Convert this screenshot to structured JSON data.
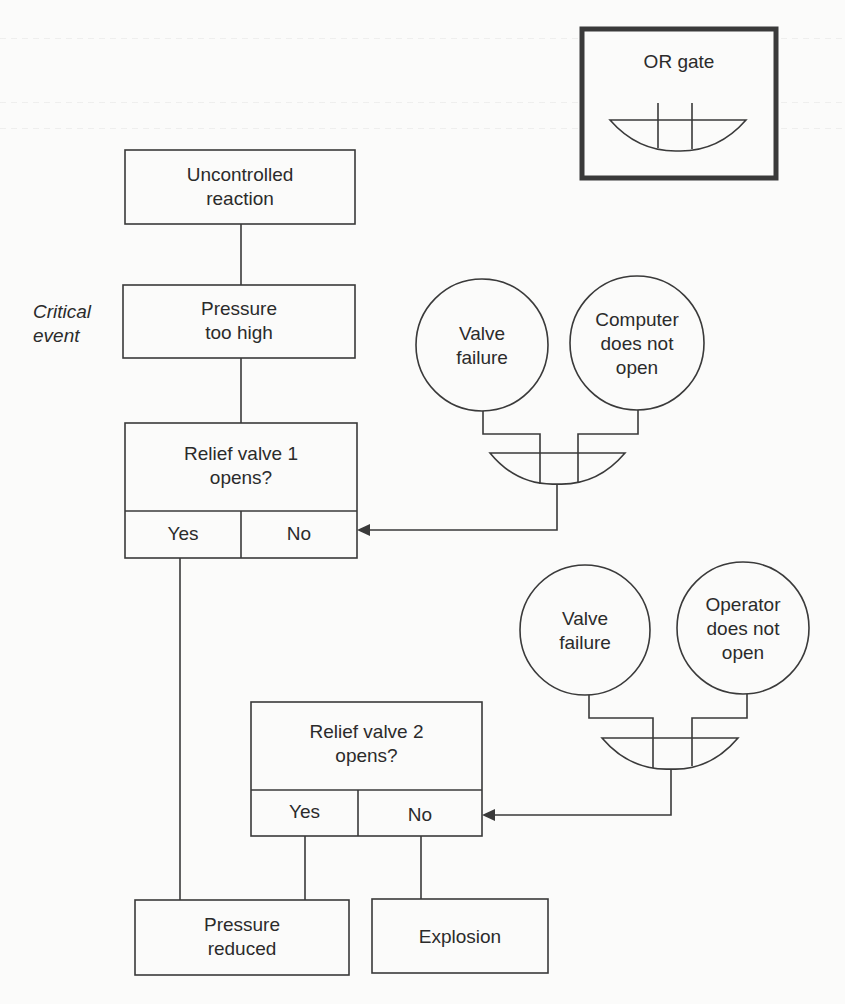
{
  "legend": {
    "title": "OR gate"
  },
  "side_label": {
    "text": "Critical\nevent"
  },
  "nodes": {
    "uncontrolled_reaction": {
      "label": "Uncontrolled\nreaction"
    },
    "pressure_too_high": {
      "label": "Pressure\ntoo high"
    },
    "relief_valve_1": {
      "label": "Relief valve 1\nopens?",
      "yes": "Yes",
      "no": "No"
    },
    "relief_valve_2": {
      "label": "Relief valve 2\nopens?",
      "yes": "Yes",
      "no": "No"
    },
    "pressure_reduced": {
      "label": "Pressure\nreduced"
    },
    "explosion": {
      "label": "Explosion"
    }
  },
  "gates": [
    {
      "type": "OR",
      "inputs": [
        {
          "label": "Valve\nfailure"
        },
        {
          "label": "Computer\ndoes not\nopen"
        }
      ],
      "feeds": "relief_valve_1.no"
    },
    {
      "type": "OR",
      "inputs": [
        {
          "label": "Valve\nfailure"
        },
        {
          "label": "Operator\ndoes not\nopen"
        }
      ],
      "feeds": "relief_valve_2.no"
    }
  ],
  "colors": {
    "line": "#3a3a3a",
    "text": "#2b2b2b",
    "paper": "#fbfbfa"
  }
}
